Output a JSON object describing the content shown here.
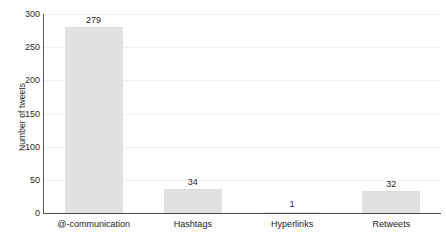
{
  "chart_data": {
    "type": "bar",
    "title": "",
    "xlabel": "",
    "ylabel": "Number of tweets",
    "categories": [
      "@-communication",
      "Hashtags",
      "Hyperlinks",
      "Retweets"
    ],
    "values": [
      279,
      34,
      1,
      32
    ],
    "value_labels": [
      "279",
      "34",
      "1",
      "32"
    ],
    "ylim": [
      0,
      300
    ],
    "yticks": [
      0,
      50,
      100,
      150,
      200,
      250,
      300
    ],
    "ytick_labels": [
      "0",
      "50",
      "100",
      "150",
      "200",
      "250",
      "300"
    ],
    "grid": true,
    "legend": "none",
    "colors": {
      "bar_fill": "#e2e2e2",
      "axis": "#4a4a4a",
      "gridline": "#f0f0f0",
      "text": "#222222",
      "background": "#ffffff"
    }
  }
}
